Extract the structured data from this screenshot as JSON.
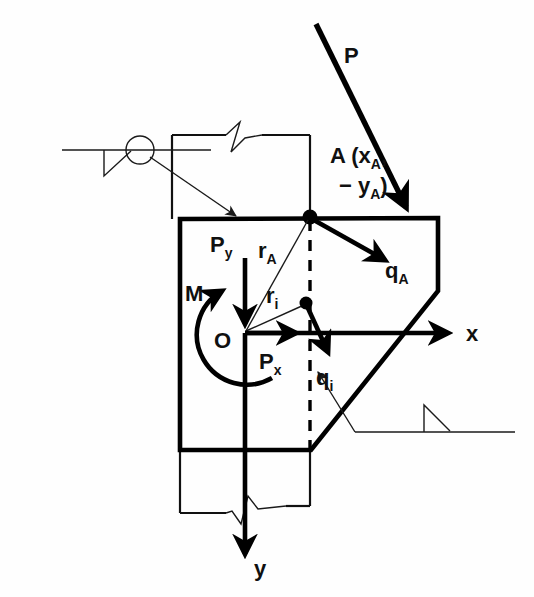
{
  "figure": {
    "background_color": "#fefefe",
    "line_color": "#000000",
    "labels": {
      "load_P": "P",
      "point_A_line1": "A (x",
      "point_A_sub1": "A",
      "point_A_line1_end": ",",
      "point_A_line2": "− y",
      "point_A_sub2": "A",
      "point_A_line2_end": ")",
      "force_qA": "q",
      "force_qA_sub": "A",
      "force_qi": "q",
      "force_qi_sub": "i",
      "radius_rA": "r",
      "radius_rA_sub": "A",
      "radius_ri": "r",
      "radius_ri_sub": "i",
      "origin_O": "O",
      "moment_M": "M",
      "force_Px": "P",
      "force_Px_sub": "x",
      "force_Py": "P",
      "force_Py_sub": "y",
      "axis_x": "x",
      "axis_y": "y"
    },
    "geometry": {
      "origin_point": {
        "x": 245,
        "y": 333
      },
      "point_A": {
        "x": 310,
        "y": 217
      },
      "point_i": {
        "x": 306,
        "y": 303
      },
      "axis_x_tip": {
        "x": 456,
        "y": 333
      },
      "axis_y_tip": {
        "x": 245,
        "y": 562
      }
    },
    "annotations": {
      "section_marker_top": "section-cut-symbol",
      "section_marker_bottom": "section-cut-symbol",
      "break_symbol_top": "column-break-symbol",
      "break_symbol_bottom": "column-break-symbol"
    }
  }
}
